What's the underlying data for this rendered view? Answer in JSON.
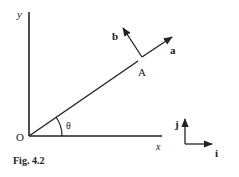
{
  "figure": {
    "caption": "Fig. 4.2",
    "axes": {
      "x_label": "x",
      "y_label": "y",
      "origin_label": "O"
    },
    "angle_label": "θ",
    "point_label": "A",
    "vectors": {
      "a_label": "a",
      "b_label": "b"
    },
    "basis": {
      "i_label": "i",
      "j_label": "j"
    },
    "colors": {
      "ink": "#222222",
      "background": "#ffffff"
    }
  }
}
